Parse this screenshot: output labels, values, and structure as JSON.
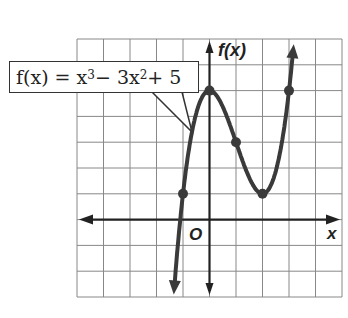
{
  "chart_data": {
    "type": "line",
    "title": "",
    "function_label": {
      "prefix": "f(x) = x",
      "exp1": "3",
      "mid": " − 3x",
      "exp2": "2",
      "suffix": " + 5"
    },
    "equation": "f(x) = x^3 - 3x^2 + 5",
    "xlabel": "x",
    "ylabel": "f(x)",
    "origin_label": "O",
    "xlim": [
      -5,
      5
    ],
    "ylim": [
      -3,
      7
    ],
    "grid": true,
    "marked_points": [
      {
        "x": -1,
        "y": 1
      },
      {
        "x": 0,
        "y": 5
      },
      {
        "x": 1,
        "y": 3
      },
      {
        "x": 2,
        "y": 1
      },
      {
        "x": 3,
        "y": 5
      }
    ],
    "curve_domain": [
      -1.5,
      3.5
    ]
  },
  "style": {
    "grid_color": "#888888",
    "curve_color": "#3a3a3a",
    "axis_color": "#222222"
  }
}
